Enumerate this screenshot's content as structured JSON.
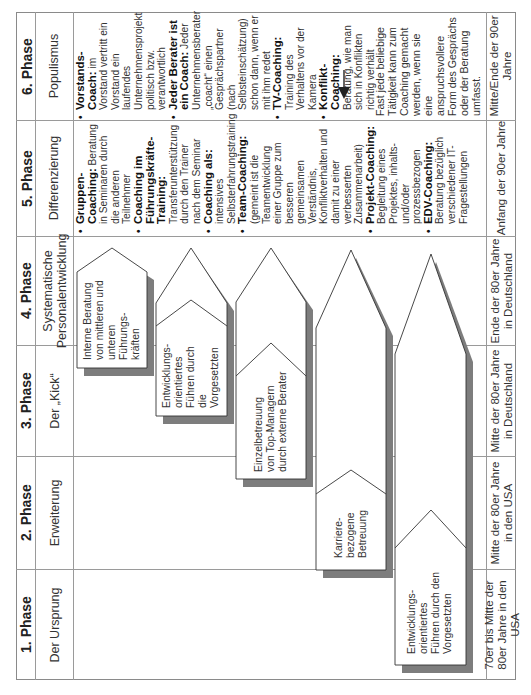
{
  "phases": [
    {
      "title": "6. Phase",
      "subtitle": "Populismus",
      "period": "Mitte/Ende der 90er Jahre",
      "items": [
        {
          "heading": "Vorstands-Coach:",
          "text": "im Vorstand vertritt ein Vorstand ein laufendes Unternehmensprojekt politisch bzw. verantwortlich"
        },
        {
          "heading": "Jeder Berater ist ein Coach:",
          "text": "Jeder Unternehmensberater „coacht“ einen Gesprächspartner (nach Selbsteinschätzung) schon dann, wenn er mit ihm redet"
        },
        {
          "heading": "TV-Coaching:",
          "text": "Training des Verhaltens vor der Kamera"
        },
        {
          "heading": "Konflikt-Coaching:",
          "text": "Beratung, wie man sich in Konflikten richtig verhält"
        }
      ],
      "note": "Fast jede beliebige Tätigkeit kann zum Coaching gemacht werden, wenn sie eine anspruchsvollere Form des Gesprächs oder der Beratung umfasst.",
      "note_arrow_icon": "right-arrow"
    },
    {
      "title": "5. Phase",
      "subtitle": "Differenzierung",
      "period": "Anfang der 90er Jahre",
      "items": [
        {
          "heading": "Gruppen-Coaching:",
          "text": "Beratung in Seminaren durch die anderen Teilnehmer"
        },
        {
          "heading": "Coaching im Führungskräfte-Training:",
          "text": "Transferunterstützung durch den Trainer nach dem Seminar"
        },
        {
          "heading": "Coaching als:",
          "text": "intensives Selbsterfahrungstraining"
        },
        {
          "heading": "Team-Coaching:",
          "text": "(gemeint ist die Teamentwicklung einer Gruppe zum besseren gemeinsamen Verständnis, Konfliktverhalten und damit zu einer verbesserten Zusammenarbeit)"
        },
        {
          "heading": "Projekt-Coaching:",
          "text": "Begleitung eines Projektes, inhalts- und/oder prozessbezogen"
        },
        {
          "heading": "EDV-Coaching:",
          "text": "Beratung bezüglich verschiedener IT-Fragestellungen"
        }
      ]
    },
    {
      "title": "4. Phase",
      "subtitle": "Systematische Personalentwicklung",
      "period": "Ende der 80er Jahre in Deutschland"
    },
    {
      "title": "3. Phase",
      "subtitle": "Der „Kick“",
      "period": "Mitte der 80er Jahre in Deutschland"
    },
    {
      "title": "2. Phase",
      "subtitle": "Erweiterung",
      "period": "Mitte der 80er Jahre in den USA"
    },
    {
      "title": "1. Phase",
      "subtitle": "Der Ursprung",
      "period": "70er bis Mitte der 80er Jahre in den USA"
    }
  ],
  "arrows": [
    {
      "label": "Interne Beratung von mittleren und unteren Führungskräften"
    },
    {
      "label": "Entwicklungsorientiertes Führen durch die Vorgesetzten"
    },
    {
      "label": "Einzelbetreuung von Top-Managern durch externe Berater"
    },
    {
      "label": "Karrierebezogene Betreuung"
    },
    {
      "label": "Entwicklungsorientiertes Führen durch den Vorgesetzten"
    }
  ],
  "arrow_lines": [
    [
      "Interne Beratung",
      "von mittleren und",
      "unteren Führungs-",
      "kräften"
    ],
    [
      "Entwicklungs-",
      "orientiertes",
      "Führen durch die",
      "Vorgesetzten"
    ],
    [
      "Einzelbetreuung",
      "von Top-Managern",
      "durch externe Berater"
    ],
    [
      "Karriere-",
      "bezogene",
      "Betreuung"
    ],
    [
      "Entwicklungs-",
      "orientiertes",
      "Führen durch den",
      "Vorgesetzten"
    ]
  ],
  "colors": {
    "grid": "#9a9a9a",
    "shadow": "#7d7d7d",
    "arrow_fill": "#ffffff",
    "arrow_stroke": "#333333"
  }
}
